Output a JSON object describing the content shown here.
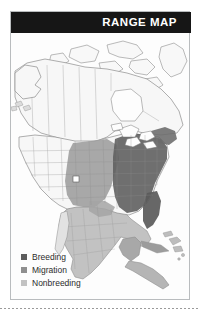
{
  "card": {
    "title": "RANGE MAP"
  },
  "map": {
    "projection_note": "North America",
    "ocean_color": "#fdfdfd",
    "land_color": "#f7f7f7",
    "border_color": "#8d8d8d",
    "regions": [
      {
        "name": "Alaska",
        "status": "unshaded"
      },
      {
        "name": "Canada",
        "status": "unshaded"
      },
      {
        "name": "Western United States",
        "status": "unshaded"
      },
      {
        "name": "Central Plains",
        "status": "migration"
      },
      {
        "name": "Eastern United States",
        "status": "breeding"
      },
      {
        "name": "Florida",
        "status": "breeding"
      },
      {
        "name": "Texas Coast",
        "status": "migration"
      },
      {
        "name": "Mexico",
        "status": "nonbreeding"
      },
      {
        "name": "Yucatan Peninsula",
        "status": "nonbreeding"
      },
      {
        "name": "Central America",
        "status": "nonbreeding"
      },
      {
        "name": "Cuba",
        "status": "nonbreeding"
      },
      {
        "name": "Caribbean Islands",
        "status": "nonbreeding"
      }
    ]
  },
  "legend": {
    "items": [
      {
        "label": "Breeding",
        "color": "#5c5c5c"
      },
      {
        "label": "Migration",
        "color": "#8f8f8f"
      },
      {
        "label": "Nonbreeding",
        "color": "#c2c2c2"
      }
    ]
  }
}
